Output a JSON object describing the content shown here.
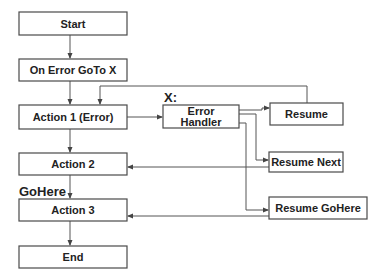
{
  "diagram": {
    "type": "flowchart",
    "nodes": {
      "start": "Start",
      "on_error": "On Error GoTo X",
      "action1": "Action 1 (Error)",
      "action2": "Action 2",
      "action3": "Action 3",
      "end": "End",
      "handler_line1": "Error",
      "handler_line2": "Handler",
      "resume": "Resume",
      "resume_next": "Resume Next",
      "resume_gohere": "Resume GoHere"
    },
    "labels": {
      "x_label": "X:",
      "gohere_label": "GoHere"
    },
    "edges": [
      {
        "from": "Start",
        "to": "On Error GoTo X"
      },
      {
        "from": "On Error GoTo X",
        "to": "Action 1 (Error)"
      },
      {
        "from": "Action 1 (Error)",
        "to": "Action 2"
      },
      {
        "from": "Action 2",
        "to": "Action 3"
      },
      {
        "from": "Action 3",
        "to": "End"
      },
      {
        "from": "Action 1 (Error)",
        "to": "Error Handler"
      },
      {
        "from": "Error Handler",
        "to": "Resume"
      },
      {
        "from": "Error Handler",
        "to": "Resume Next"
      },
      {
        "from": "Error Handler",
        "to": "Resume GoHere"
      },
      {
        "from": "Resume",
        "to": "Action 1 (Error)"
      },
      {
        "from": "Resume Next",
        "to": "Action 2"
      },
      {
        "from": "Resume GoHere",
        "to": "Action 3"
      }
    ]
  }
}
